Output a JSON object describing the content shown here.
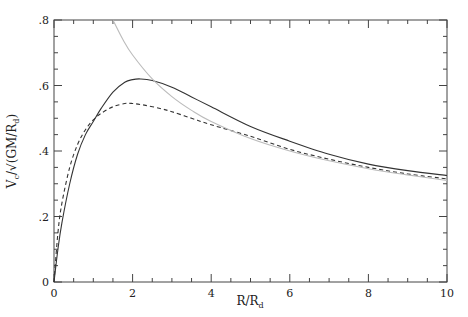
{
  "chart_data": {
    "type": "line",
    "title": "",
    "xlabel": "R/R",
    "xlabel_sub": "d",
    "ylabel": "V",
    "ylabel_sub": "c",
    "ylabel_rest": "/√(GM/R",
    "ylabel_rest_sub": "d",
    "ylabel_close": ")",
    "xlim": [
      0,
      10
    ],
    "ylim": [
      0,
      0.8
    ],
    "xticks": [
      0,
      2,
      4,
      6,
      8,
      10
    ],
    "xtick_labels": [
      "0",
      "2",
      "4",
      "6",
      "8",
      "10"
    ],
    "yticks": [
      0,
      0.2,
      0.4,
      0.6,
      0.8
    ],
    "ytick_labels": [
      "0",
      ".2",
      ".4",
      ".6",
      ".8"
    ],
    "x_minor_step": 0.5,
    "y_minor_step": 0.05,
    "grid": false,
    "series": [
      {
        "name": "solid",
        "style": "solid",
        "color": "#333333",
        "x": [
          0,
          0.1,
          0.2,
          0.4,
          0.6,
          0.8,
          1.0,
          1.2,
          1.5,
          1.8,
          2.0,
          2.2,
          2.5,
          3.0,
          3.5,
          4.0,
          5.0,
          6.0,
          7.0,
          8.0,
          9.0,
          10.0
        ],
        "y": [
          0,
          0.1,
          0.18,
          0.3,
          0.39,
          0.45,
          0.49,
          0.53,
          0.58,
          0.61,
          0.618,
          0.62,
          0.615,
          0.595,
          0.565,
          0.535,
          0.475,
          0.43,
          0.39,
          0.36,
          0.34,
          0.325
        ]
      },
      {
        "name": "dashed",
        "style": "dashed",
        "color": "#333333",
        "x": [
          0,
          0.1,
          0.2,
          0.4,
          0.6,
          0.8,
          1.0,
          1.2,
          1.5,
          1.8,
          2.0,
          2.3,
          2.7,
          3.0,
          3.5,
          4.0,
          5.0,
          6.0,
          7.0,
          8.0,
          9.0,
          10.0
        ],
        "y": [
          0,
          0.15,
          0.24,
          0.35,
          0.42,
          0.465,
          0.495,
          0.515,
          0.535,
          0.545,
          0.545,
          0.54,
          0.53,
          0.52,
          0.5,
          0.48,
          0.445,
          0.405,
          0.375,
          0.35,
          0.33,
          0.315
        ]
      },
      {
        "name": "keplerian",
        "style": "solid",
        "color": "#bbbbbb",
        "x": [
          1.5,
          1.75,
          2.0,
          2.5,
          3.0,
          3.5,
          4.0,
          5.0,
          6.0,
          7.0,
          8.0,
          9.0,
          10.0
        ],
        "y": [
          0.8,
          0.741,
          0.693,
          0.62,
          0.566,
          0.524,
          0.49,
          0.438,
          0.4,
          0.37,
          0.346,
          0.327,
          0.31
        ]
      }
    ]
  }
}
